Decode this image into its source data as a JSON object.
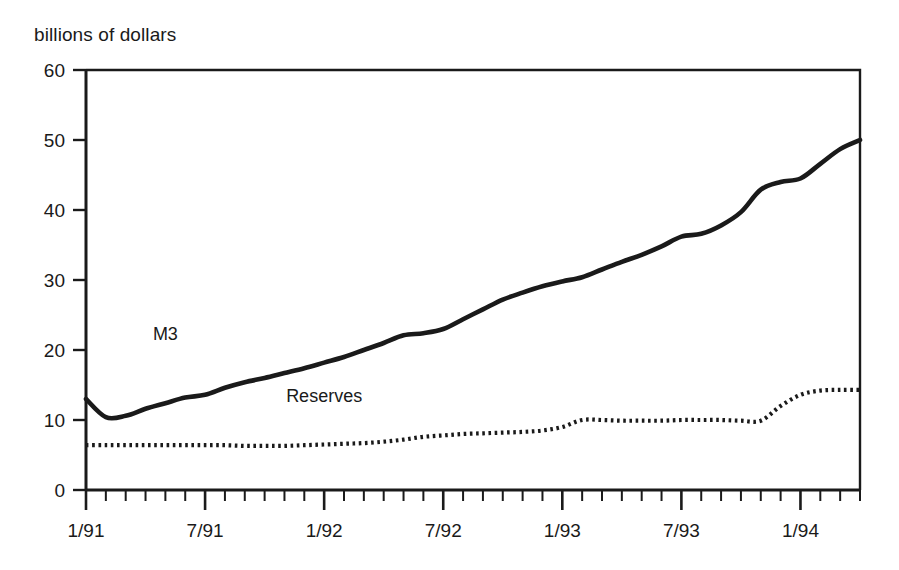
{
  "chart_data": {
    "type": "line",
    "title": "",
    "ylabel": "billions of dollars",
    "xlabel": "",
    "ylim": [
      0,
      60
    ],
    "yticks": [
      0,
      10,
      20,
      30,
      40,
      50,
      60
    ],
    "ytick_labels": [
      "0",
      "10",
      "20",
      "30",
      "40",
      "50",
      "60"
    ],
    "grid": false,
    "legend_position": "inline-annotation",
    "x_axis_type": "monthly",
    "x_start": "1/91",
    "x_end": "4/94",
    "xtick_labels": [
      "1/91",
      "7/91",
      "1/92",
      "7/92",
      "1/93",
      "7/93",
      "1/94"
    ],
    "xtick_label_indices": [
      0,
      6,
      12,
      18,
      24,
      30,
      36
    ],
    "minor_tick_interval_months": 1,
    "x": [
      "1/91",
      "2/91",
      "3/91",
      "4/91",
      "5/91",
      "6/91",
      "7/91",
      "8/91",
      "9/91",
      "10/91",
      "11/91",
      "12/91",
      "1/92",
      "2/92",
      "3/92",
      "4/92",
      "5/92",
      "6/92",
      "7/92",
      "8/92",
      "9/92",
      "10/92",
      "11/92",
      "12/92",
      "1/93",
      "2/93",
      "3/93",
      "4/93",
      "5/93",
      "6/93",
      "7/93",
      "8/93",
      "9/93",
      "10/93",
      "11/93",
      "12/93",
      "1/94",
      "2/94",
      "3/94",
      "4/94"
    ],
    "series": [
      {
        "name": "M3",
        "style": "solid-thick",
        "color": "#1a1a1a",
        "label_x": "5/91",
        "label_y": 21.5,
        "values": [
          13.0,
          10.4,
          10.6,
          11.6,
          12.4,
          13.2,
          13.6,
          14.6,
          15.4,
          16.0,
          16.7,
          17.4,
          18.2,
          19.0,
          20.0,
          21.0,
          22.1,
          22.4,
          23.0,
          24.4,
          25.8,
          27.2,
          28.2,
          29.1,
          29.8,
          30.4,
          31.5,
          32.6,
          33.6,
          34.8,
          36.2,
          36.6,
          37.8,
          39.7,
          42.9,
          44.0,
          44.5,
          46.6,
          48.7,
          50.0
        ]
      },
      {
        "name": "Reserves",
        "style": "dotted",
        "color": "#1a1a1a",
        "label_x": "1/92",
        "label_y": 12.6,
        "values": [
          6.4,
          6.4,
          6.4,
          6.4,
          6.4,
          6.4,
          6.4,
          6.4,
          6.3,
          6.3,
          6.3,
          6.4,
          6.5,
          6.6,
          6.7,
          6.9,
          7.2,
          7.6,
          7.8,
          8.0,
          8.1,
          8.2,
          8.3,
          8.5,
          9.0,
          10.0,
          10.0,
          9.9,
          9.9,
          9.9,
          10.0,
          10.0,
          10.0,
          9.9,
          9.9,
          12.0,
          13.6,
          14.2,
          14.3,
          14.3
        ]
      }
    ],
    "series_extra": {
      "m3_tail": {
        "note": "declines slightly after peak",
        "peak_value": 50.2,
        "end_value": 49.2
      }
    }
  },
  "labels": {
    "m3": "M3",
    "reserves": "Reserves"
  }
}
